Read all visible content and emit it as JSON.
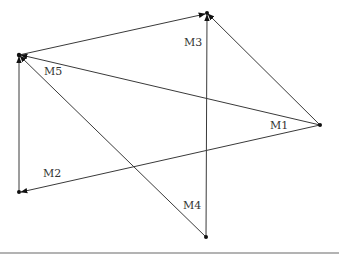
{
  "diagram": {
    "nodes": [
      {
        "id": "A",
        "x": 19,
        "y": 55
      },
      {
        "id": "B",
        "x": 207,
        "y": 13
      },
      {
        "id": "C",
        "x": 320,
        "y": 125
      },
      {
        "id": "D",
        "x": 19,
        "y": 192
      },
      {
        "id": "E",
        "x": 206,
        "y": 237
      }
    ],
    "edges": [
      {
        "from": "A",
        "to": "B",
        "arrow": "end"
      },
      {
        "from": "E",
        "to": "B",
        "arrow": "end"
      },
      {
        "from": "C",
        "to": "B",
        "arrow": "end"
      },
      {
        "from": "C",
        "to": "A",
        "arrow": "end"
      },
      {
        "from": "C",
        "to": "D",
        "arrow": "end"
      },
      {
        "from": "E",
        "to": "A",
        "arrow": "end"
      },
      {
        "from": "D",
        "to": "A",
        "arrow": "end"
      }
    ],
    "labels": {
      "m1": "M1",
      "m2": "M2",
      "m3": "M3",
      "m4": "M4",
      "m5": "M5"
    },
    "colors": {
      "line": "#3a3a3a",
      "node": "#111111",
      "rule": "#9a9a9a"
    }
  }
}
